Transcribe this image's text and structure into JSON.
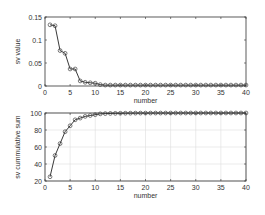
{
  "chart_data": [
    {
      "type": "line",
      "title": "",
      "xlabel": "number",
      "ylabel": "sv value",
      "xlim": [
        0,
        40
      ],
      "ylim": [
        0,
        0.15
      ],
      "xticks": [
        0,
        5,
        10,
        15,
        20,
        25,
        30,
        35,
        40
      ],
      "yticks": [
        0,
        0.05,
        0.1,
        0.15
      ],
      "ytick_labels": [
        "0",
        "0.05",
        "0.1",
        "0.15"
      ],
      "grid": false,
      "marker": "circle",
      "x": [
        1,
        2,
        3,
        4,
        5,
        6,
        7,
        8,
        9,
        10,
        11,
        12,
        13,
        14,
        15,
        16,
        17,
        18,
        19,
        20,
        21,
        22,
        23,
        24,
        25,
        26,
        27,
        28,
        29,
        30,
        31,
        32,
        33,
        34,
        35,
        36,
        37,
        38,
        39,
        40
      ],
      "values": [
        0.133,
        0.131,
        0.077,
        0.071,
        0.037,
        0.037,
        0.011,
        0.008,
        0.007,
        0.006,
        0.003,
        0.002,
        0.002,
        0.002,
        0.002,
        0.002,
        0.002,
        0.002,
        0.002,
        0.002,
        0.002,
        0.002,
        0.002,
        0.002,
        0.002,
        0.002,
        0.002,
        0.002,
        0.002,
        0.002,
        0.002,
        0.002,
        0.002,
        0.002,
        0.002,
        0.002,
        0.002,
        0.002,
        0.002,
        0.002
      ]
    },
    {
      "type": "line",
      "title": "",
      "xlabel": "number",
      "ylabel": "sv cummulative sum",
      "xlim": [
        0,
        40
      ],
      "ylim": [
        20,
        100
      ],
      "xticks": [
        0,
        5,
        10,
        15,
        20,
        25,
        30,
        35,
        40
      ],
      "yticks": [
        20,
        40,
        60,
        80,
        100
      ],
      "ytick_labels": [
        "20",
        "40",
        "60",
        "80",
        "100"
      ],
      "grid": true,
      "marker": "circle",
      "x": [
        1,
        2,
        3,
        4,
        5,
        6,
        7,
        8,
        9,
        10,
        11,
        12,
        13,
        14,
        15,
        16,
        17,
        18,
        19,
        20,
        21,
        22,
        23,
        24,
        25,
        26,
        27,
        28,
        29,
        30,
        31,
        32,
        33,
        34,
        35,
        36,
        37,
        38,
        39,
        40
      ],
      "values": [
        25,
        50,
        64,
        78,
        85,
        92,
        94,
        96,
        97,
        98,
        99,
        99.3,
        99.5,
        99.6,
        99.7,
        99.75,
        99.8,
        99.85,
        99.9,
        99.9,
        99.92,
        99.93,
        99.94,
        99.95,
        99.96,
        99.96,
        99.97,
        99.97,
        99.98,
        99.98,
        99.98,
        99.99,
        99.99,
        99.99,
        99.99,
        100,
        100,
        100,
        100,
        100
      ]
    }
  ],
  "colors": {
    "line": "#222222",
    "marker": "#444444",
    "axis": "#333333",
    "grid": "#dddddd"
  }
}
